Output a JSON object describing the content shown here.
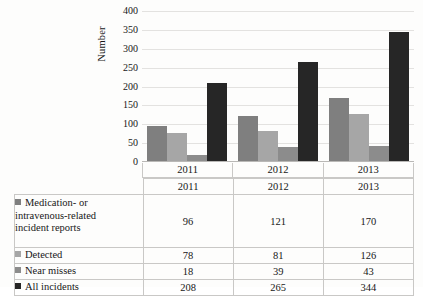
{
  "chart_data": {
    "type": "bar",
    "title": "",
    "xlabel": "",
    "ylabel": "Number",
    "categories": [
      "2011",
      "2012",
      "2013"
    ],
    "ylim": [
      0,
      400
    ],
    "yticks": [
      0,
      50,
      100,
      150,
      200,
      250,
      300,
      350,
      400
    ],
    "grid": true,
    "legend_position": "table-below",
    "series": [
      {
        "name": "Medication- or intravenous-related incident reports",
        "color": "#7f7f7f",
        "values": [
          96,
          121,
          170
        ]
      },
      {
        "name": "Detected",
        "color": "#a6a6a6",
        "values": [
          78,
          81,
          126
        ]
      },
      {
        "name": "Near misses",
        "color": "#8c8c8c",
        "values": [
          18,
          39,
          43
        ]
      },
      {
        "name": "All incidents",
        "color": "#262626",
        "values": [
          208,
          265,
          344
        ]
      }
    ]
  },
  "axis": {
    "y_title": "Number",
    "y_tick_labels": [
      "400",
      "350",
      "300",
      "250",
      "200",
      "150",
      "100",
      "50",
      "0"
    ],
    "x_tick_labels": [
      "2011",
      "2012",
      "2013"
    ]
  },
  "table": {
    "column_headers": [
      "",
      "2011",
      "2012",
      "2013"
    ],
    "rows": [
      {
        "label_line1": "Medication- or",
        "label_line2": "intravenous-related",
        "label_line3": "incident reports",
        "label": "Medication- or intravenous-related incident reports",
        "swatch_color": "#7f7f7f",
        "values": [
          "96",
          "121",
          "170"
        ]
      },
      {
        "label": "Detected",
        "swatch_color": "#a6a6a6",
        "values": [
          "78",
          "81",
          "126"
        ]
      },
      {
        "label": "Near misses",
        "swatch_color": "#8c8c8c",
        "values": [
          "18",
          "39",
          "43"
        ]
      },
      {
        "label": "All incidents",
        "swatch_color": "#262626",
        "values": [
          "208",
          "265",
          "344"
        ]
      }
    ]
  }
}
